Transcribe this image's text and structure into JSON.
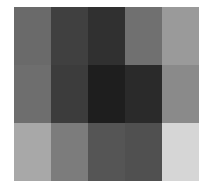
{
  "chart_data": {
    "type": "heatmap",
    "title": "",
    "xlabel": "",
    "ylabel": "",
    "rows": 3,
    "cols": 5,
    "colormap": "grayscale (darker = higher value)",
    "values": [
      [
        0.58,
        0.75,
        0.81,
        0.56,
        0.4
      ],
      [
        0.57,
        0.76,
        0.88,
        0.84,
        0.46
      ],
      [
        0.34,
        0.51,
        0.67,
        0.69,
        0.16
      ]
    ],
    "colors": [
      [
        "#6a6a6a",
        "#404040",
        "#303030",
        "#707070",
        "#9a9a9a"
      ],
      [
        "#6e6e6e",
        "#3c3c3c",
        "#1e1e1e",
        "#2a2a2a",
        "#8a8a8a"
      ],
      [
        "#a8a8a8",
        "#7c7c7c",
        "#555555",
        "#505050",
        "#d6d6d6"
      ]
    ],
    "grid": false,
    "legend": "none"
  }
}
